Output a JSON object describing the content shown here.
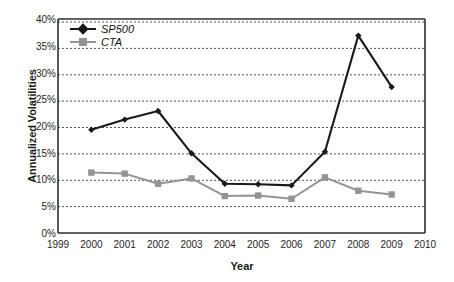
{
  "chart_data": {
    "type": "line",
    "title": "",
    "xlabel": "Year",
    "ylabel": "Annualized Volatilities",
    "x": [
      2000,
      2001,
      2002,
      2003,
      2004,
      2005,
      2006,
      2007,
      2008,
      2009
    ],
    "xlim": [
      1999,
      2010
    ],
    "ylim": [
      0,
      40
    ],
    "xticks": [
      "1999",
      "2000",
      "2001",
      "2002",
      "2003",
      "2004",
      "2005",
      "2006",
      "2007",
      "2008",
      "2009",
      "2010"
    ],
    "yticks": [
      "0%",
      "5%",
      "10%",
      "15%",
      "20%",
      "25%",
      "30%",
      "35%",
      "40%"
    ],
    "grid": "horizontal-dashed",
    "legend_position": "top-left-inside",
    "series": [
      {
        "name": "SP500",
        "color": "#1a1a1a",
        "marker": "diamond",
        "values": [
          19.3,
          21.2,
          22.8,
          14.9,
          9.2,
          9.1,
          8.9,
          15.2,
          36.9,
          27.3
        ]
      },
      {
        "name": "CTA",
        "color": "#949494",
        "marker": "square",
        "values": [
          11.3,
          11.1,
          9.2,
          10.2,
          6.9,
          7.0,
          6.4,
          10.4,
          7.9,
          7.2
        ]
      }
    ]
  }
}
